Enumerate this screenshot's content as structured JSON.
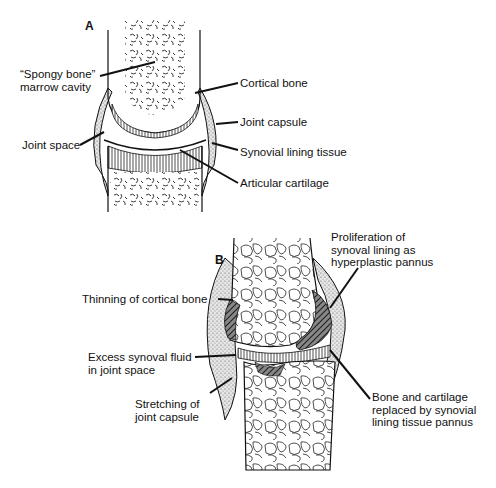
{
  "figure": {
    "panel_a": {
      "letter": "A",
      "title": "Normal joint",
      "labels": {
        "spongy_bone": "“Spongy bone”\nmarrow cavity",
        "cortical_bone": "Cortical bone",
        "joint_capsule": "Joint capsule",
        "joint_space": "Joint space",
        "synovial_lining": "Synovial lining tissue",
        "articular_cartilage": "Articular cartilage"
      }
    },
    "panel_b": {
      "letter": "B",
      "title": "Rheumatoid joint",
      "labels": {
        "thinning_cortical": "Thinning of cortical bone",
        "excess_fluid": "Excess synoval fluid\nin joint space",
        "stretching_capsule": "Stretching of\njoint capsule",
        "proliferation": "Proliferation of\nsynoval lining as\nhyperplastic pannus",
        "bone_replaced": "Bone and cartilage\nreplaced by synovial\nlining tissue pannus"
      }
    },
    "colors": {
      "ink": "#111111",
      "background": "#ffffff",
      "stipple": "#bdbdbd"
    }
  }
}
